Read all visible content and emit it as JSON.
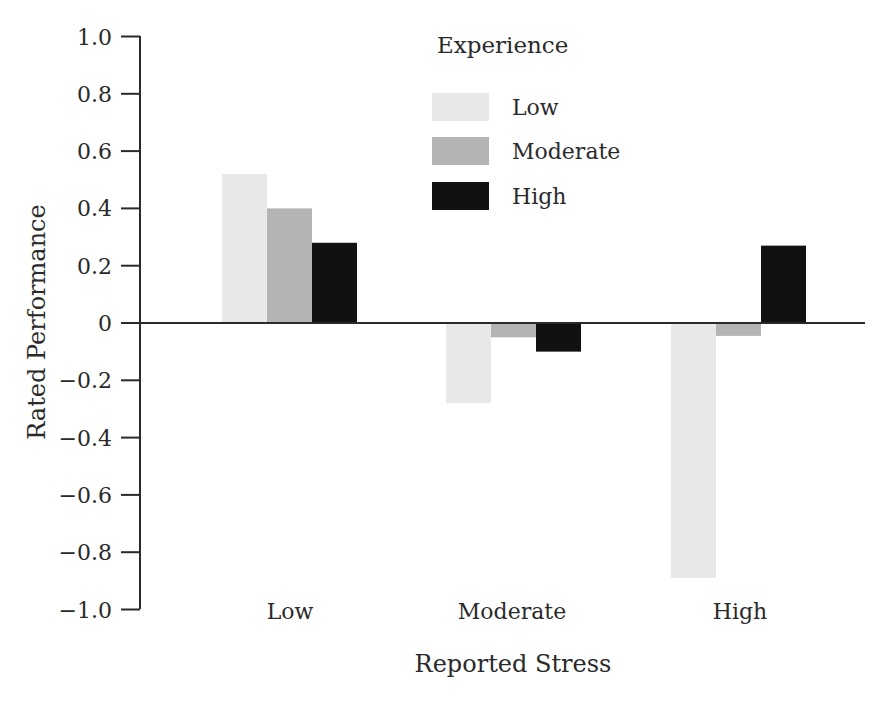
{
  "chart_data": {
    "type": "bar",
    "title": "",
    "xlabel": "Reported Stress",
    "ylabel": "Rated Performance",
    "ylim": [
      -1.0,
      1.0
    ],
    "yticks": [
      "1.0",
      "0.8",
      "0.6",
      "0.4",
      "0.2",
      "0",
      "−0.2",
      "−0.4",
      "−0.6",
      "−0.8",
      "−1.0"
    ],
    "ytick_values": [
      1.0,
      0.8,
      0.6,
      0.4,
      0.2,
      0,
      -0.2,
      -0.4,
      -0.6,
      -0.8,
      -1.0
    ],
    "grid": false,
    "categories": [
      "Low",
      "Moderate",
      "High"
    ],
    "legend": {
      "title": "Experience",
      "position": "top-center",
      "entries": [
        "Low",
        "Moderate",
        "High"
      ]
    },
    "series": [
      {
        "name": "Low",
        "color": "#e8e8e8",
        "values": [
          0.52,
          -0.28,
          -0.89
        ]
      },
      {
        "name": "Moderate",
        "color": "#b4b4b4",
        "values": [
          0.4,
          -0.05,
          -0.045
        ]
      },
      {
        "name": "High",
        "color": "#111111",
        "values": [
          0.28,
          -0.1,
          0.27
        ]
      }
    ]
  }
}
